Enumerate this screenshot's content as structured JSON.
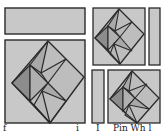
{
  "diagram": {
    "colors": {
      "background": "#ffffff",
      "fill_light": "#c8c8c8",
      "fill_mid": "#a9a9a9",
      "fill_dark": "#8c8c8c",
      "stroke": "#2a2a2a"
    },
    "pieces": [
      {
        "id": "top-strip",
        "shape": "rectangle"
      },
      {
        "id": "left-large-block",
        "shape": "square-with-diamond-pinwheel"
      },
      {
        "id": "top-right-block",
        "shape": "square-with-diamond-pinwheel"
      },
      {
        "id": "right-side-strip",
        "shape": "rectangle"
      },
      {
        "id": "bottom-side-strip",
        "shape": "rectangle"
      },
      {
        "id": "bottom-right-block",
        "shape": "square-with-diamond-pinwheel"
      }
    ],
    "caption": {
      "left": "f",
      "mid": "i",
      "mid2": "I",
      "right": "Pin Wh l"
    }
  }
}
